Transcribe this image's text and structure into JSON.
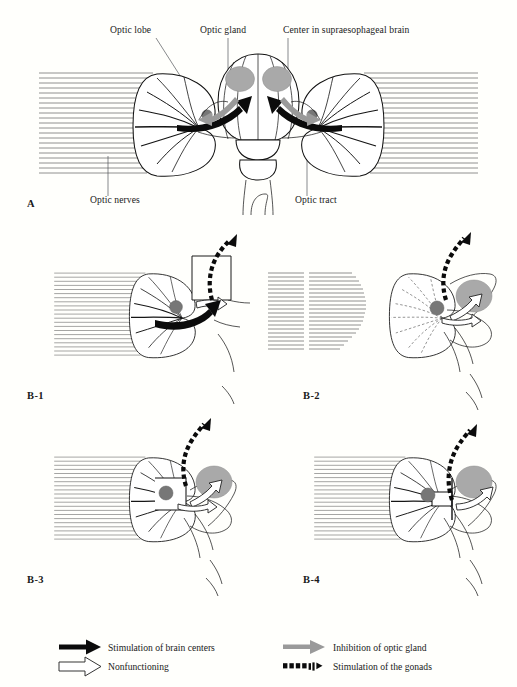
{
  "figure": {
    "background_color": "#fffffc",
    "ink_color": "#111111",
    "gland_color": "#a9a9a9",
    "gland_dark_color": "#777777",
    "gray_arrow_color": "#9a9a9a"
  },
  "panel_a": {
    "id": "A",
    "labels": {
      "optic_lobe": "Optic lobe",
      "optic_gland": "Optic gland",
      "supraesophageal": "Center in supraesophageal brain",
      "optic_nerves": "Optic nerves",
      "optic_tract": "Optic tract"
    }
  },
  "panel_b1": {
    "id": "B-1",
    "state": "optic tract severed; optic gland removed from view"
  },
  "panel_b2": {
    "id": "B-2",
    "state": "optic nerves severed; gland active"
  },
  "panel_b3": {
    "id": "B-3",
    "state": "optic lobe isolated; gland active"
  },
  "panel_b4": {
    "id": "B-4",
    "state": "tract cut distally; gland active"
  },
  "legend": {
    "items": [
      {
        "key": "stimulation-brain",
        "symbol": "black-arrow",
        "label": "Stimulation of brain centers",
        "color": "#0b0b0b"
      },
      {
        "key": "nonfunctioning",
        "symbol": "open-arrow",
        "label": "Nonfunctioning",
        "color": "#ffffff"
      },
      {
        "key": "inhibition-gland",
        "symbol": "gray-arrow",
        "label": "Inhibition of optic gland",
        "color": "#9a9a9a"
      },
      {
        "key": "stimulation-gonads",
        "symbol": "dashed-arrow",
        "label": "Stimulation of the gonads",
        "color": "#0b0b0b"
      }
    ]
  }
}
